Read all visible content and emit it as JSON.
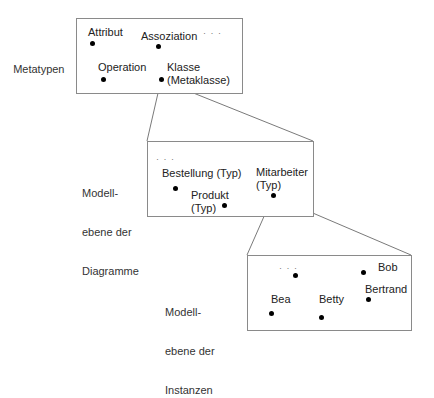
{
  "side_labels": {
    "meta": "Metatypen",
    "diagram": [
      "Modell-",
      "ebene der",
      "Diagramme"
    ],
    "instance": [
      "Modell-",
      "ebene der",
      "Instanzen"
    ]
  },
  "meta_box": {
    "items": {
      "attribut": "Attribut",
      "assoziation": "Assoziation",
      "ellipsis": "· · ·",
      "operation": "Operation",
      "klasse": [
        "Klasse",
        "(Metaklasse)"
      ]
    }
  },
  "diagram_box": {
    "items": {
      "ellipsis": "· · ·",
      "bestellung": "Bestellung (Typ)",
      "produkt": [
        "Produkt",
        "(Typ)"
      ],
      "mitarbeiter": [
        "Mitarbeiter",
        "(Typ)"
      ]
    }
  },
  "instance_box": {
    "items": {
      "ellipsis": "· · ·",
      "bob": "Bob",
      "bertrand": "Bertrand",
      "bea": "Bea",
      "betty": "Betty"
    }
  },
  "colors": {
    "line": "#7a7a7a",
    "border": "#8a8a8a",
    "dot": "#000000"
  }
}
